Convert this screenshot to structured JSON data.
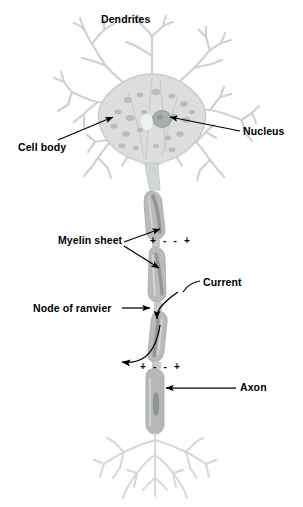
{
  "figure": {
    "background_color": "#ffffff"
  },
  "labels": {
    "dendrites": "Dendrites",
    "cell_body": "Cell body",
    "nucleus": "Nucleus",
    "myelin_sheet": "Myelin sheet",
    "current": "Current",
    "node_of_ranvier": "Node of ranvier",
    "axon": "Axon"
  },
  "charge_signs": {
    "upper_node": "+ - - +",
    "lower_node": "+ - - +"
  },
  "colors": {
    "label_text": "#000000",
    "leader_line": "#000000",
    "dendrite_stroke": "#cfd2d2",
    "dendrite_fill": "#e6e8e8",
    "soma_fill": "#dcdede",
    "soma_speckle": "#b9bcbc",
    "nucleus_fill": "#a9acac",
    "myelin_fill": "#b8bbba",
    "myelin_dark": "#8a8d8d",
    "axon_fill": "#b5b8b7"
  },
  "parts": {
    "dendrite_arbor": "branched dendritic tree at top",
    "soma": "cell body with speckled cytoplasm",
    "nucleus": "dark oval inside soma",
    "myelin_segments": 4,
    "nodes_of_ranvier": 2,
    "axon_terminal_arbor": "branched terminal tree at bottom"
  }
}
